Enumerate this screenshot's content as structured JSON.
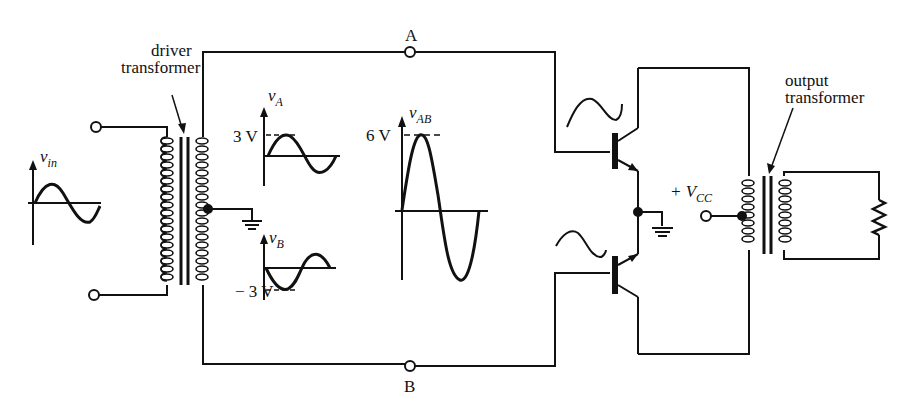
{
  "labels": {
    "node_a": "A",
    "node_b": "B",
    "driver_transformer_line1": "driver",
    "driver_transformer_line2": "transformer",
    "output_transformer_line1": "output",
    "output_transformer_line2": "transformer",
    "vin_main": "v",
    "vin_sub": "in",
    "va_main": "v",
    "va_sub": "A",
    "vb_main": "v",
    "vb_sub": "B",
    "vab_main": "v",
    "vab_sub": "AB",
    "va_peak": "3 V",
    "vb_peak": "− 3 V",
    "vab_peak": "6 V",
    "vcc_prefix": "+ V",
    "vcc_sub": "CC"
  },
  "components": [
    {
      "type": "input-terminal",
      "count": 2
    },
    {
      "type": "driver-transformer",
      "center_tap": "ground"
    },
    {
      "type": "npn-transistor",
      "position": "upper"
    },
    {
      "type": "npn-transistor",
      "position": "lower"
    },
    {
      "type": "ground",
      "count": 2
    },
    {
      "type": "output-transformer",
      "center_tap": "+VCC"
    },
    {
      "type": "resistor-load"
    },
    {
      "type": "node-terminal",
      "labels": [
        "A",
        "B"
      ]
    }
  ],
  "waveforms": {
    "vin": {
      "peak": null,
      "shape": "sine"
    },
    "vA": {
      "peak": "3 V",
      "shape": "sine"
    },
    "vB": {
      "peak": "-3 V",
      "shape": "inverted sine"
    },
    "vAB": {
      "peak": "6 V",
      "shape": "sine"
    }
  }
}
